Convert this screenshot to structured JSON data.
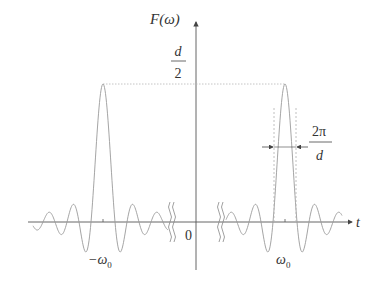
{
  "figure": {
    "y_axis_label": "F(ω)",
    "peak_label_num": "d",
    "peak_label_den": "2",
    "x_axis_label": "t",
    "origin_label": "0",
    "left_peak_label": "−ω",
    "left_peak_sub": "0",
    "right_peak_label": "ω",
    "right_peak_sub": "0",
    "width_label_num": "2π",
    "width_label_den": "d",
    "colors": {
      "curve": "#9a9a9a",
      "axis": "#555555",
      "dashed": "#b0b0b0",
      "text": "#333333"
    }
  }
}
